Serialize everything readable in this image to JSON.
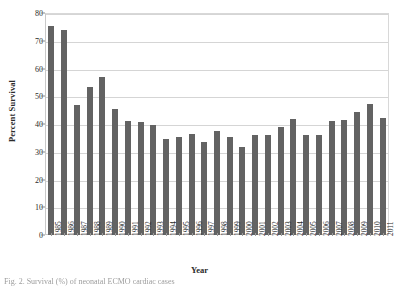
{
  "figure": {
    "caption": "Fig. 2. Survival (%) of neonatal ECMO cardiac cases"
  },
  "chart_data": {
    "type": "bar",
    "title": "",
    "xlabel": "Year",
    "ylabel": "Percent Survival",
    "ylim": [
      0,
      80
    ],
    "yticks": [
      0,
      10,
      20,
      30,
      40,
      50,
      60,
      70,
      80
    ],
    "grid": true,
    "legend": "none",
    "bar_color": "#636363",
    "categories": [
      "1985",
      "1986",
      "1987",
      "1988",
      "1989",
      "1990",
      "1991",
      "1992",
      "1993",
      "1994",
      "1995",
      "1996",
      "1997",
      "1998",
      "1999",
      "2000",
      "2001",
      "2002",
      "2003",
      "2004",
      "2005",
      "2006",
      "2007",
      "2008",
      "2009",
      "2010",
      "2011"
    ],
    "values": [
      75.5,
      74.0,
      47.0,
      53.5,
      57.0,
      45.5,
      41.0,
      40.8,
      39.5,
      34.5,
      35.2,
      36.5,
      33.5,
      37.5,
      35.2,
      31.8,
      36.2,
      36.0,
      38.8,
      41.8,
      36.0,
      35.9,
      41.0,
      41.5,
      44.5,
      47.2,
      42.0
    ]
  }
}
